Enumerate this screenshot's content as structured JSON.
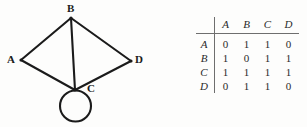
{
  "figure": {
    "type": "graph-with-adjacency-matrix",
    "background_color": "#fdfdfc",
    "ink_color": "#1b1b1b"
  },
  "graph": {
    "caption": "",
    "vertices": [
      {
        "id": "A",
        "label": "A",
        "x": 21,
        "y": 60,
        "label_x": 7,
        "label_y": 54
      },
      {
        "id": "B",
        "label": "B",
        "x": 71,
        "y": 18,
        "label_x": 67,
        "label_y": 3
      },
      {
        "id": "C",
        "label": "C",
        "x": 75,
        "y": 90,
        "label_x": 87,
        "label_y": 83
      },
      {
        "id": "D",
        "label": "D",
        "x": 131,
        "y": 61,
        "label_x": 135,
        "label_y": 54
      }
    ],
    "edges": [
      {
        "from": "A",
        "to": "B"
      },
      {
        "from": "B",
        "to": "D"
      },
      {
        "from": "A",
        "to": "C"
      },
      {
        "from": "C",
        "to": "D"
      },
      {
        "from": "B",
        "to": "C"
      }
    ],
    "self_loops": [
      {
        "at": "C",
        "center_x": 75.5,
        "center_y": 106,
        "radius": 15.5
      }
    ],
    "edge_color": "#1b1b1b",
    "edge_width": 2.1
  },
  "matrix": {
    "corner_label": "",
    "column_headers": [
      "A",
      "B",
      "C",
      "D"
    ],
    "row_headers": [
      "A",
      "B",
      "C",
      "D"
    ],
    "rows": [
      {
        "header": "A",
        "values": [
          "0",
          "1",
          "1",
          "0"
        ]
      },
      {
        "header": "B",
        "values": [
          "1",
          "0",
          "1",
          "1"
        ]
      },
      {
        "header": "C",
        "values": [
          "1",
          "1",
          "1",
          "1"
        ]
      },
      {
        "header": "D",
        "values": [
          "0",
          "1",
          "1",
          "0"
        ]
      }
    ],
    "rule_color": "#6e6e6e",
    "text_color": "#2a2a2a"
  }
}
